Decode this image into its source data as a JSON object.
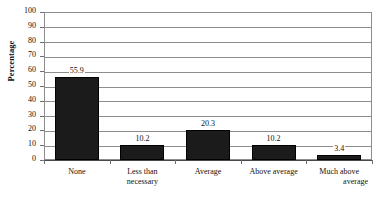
{
  "chart_data": {
    "type": "bar",
    "title": "",
    "xlabel": "",
    "ylabel": "Percentage",
    "ylim": [
      0,
      100
    ],
    "ytick_step": 10,
    "yticks": [
      "100",
      "90",
      "80",
      "70",
      "60",
      "50",
      "40",
      "30",
      "20",
      "10",
      "0"
    ],
    "grid": true,
    "legend": "none",
    "orientation": "vertical",
    "bar_color": "#1b1b1b",
    "categories": [
      "None",
      "Less than necessary",
      "Average",
      "Above average",
      "Much above average"
    ],
    "category_lines": [
      [
        "None"
      ],
      [
        "Less than",
        "necessary"
      ],
      [
        "Average"
      ],
      [
        "Above average"
      ],
      [
        "Much above",
        "average"
      ]
    ],
    "values": [
      55.9,
      10.2,
      20.3,
      10.2,
      3.4
    ],
    "value_labels": [
      "55.9",
      "10.2",
      "20.3",
      "10.2",
      "3.4"
    ]
  },
  "axis": {
    "y_title": "Percentage"
  }
}
